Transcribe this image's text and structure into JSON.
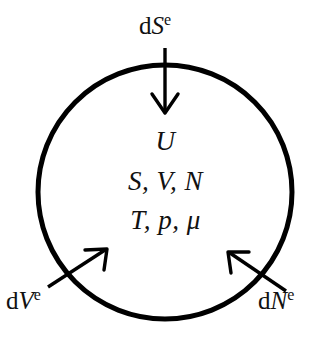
{
  "figure": {
    "background_color": "#ffffff",
    "stroke_color": "#000000",
    "width": 331,
    "height": 359
  },
  "system_boundary": {
    "shape": "circle",
    "center_x": 165,
    "center_y": 192,
    "radius": 127,
    "stroke_width": 5
  },
  "interior_variables": {
    "line_1": "U",
    "line_2": "S, V, N",
    "line_3": "T, p, μ"
  },
  "fluxes": [
    {
      "id": "entropy-flux",
      "prefix": "d",
      "symbol": "S",
      "superscript": "e",
      "label": "dSᵉ",
      "direction": "into-system-from-top",
      "arrow": {
        "x1": 165,
        "y1": 48,
        "x2": 165,
        "y2": 112
      }
    },
    {
      "id": "volume-flux",
      "prefix": "d",
      "symbol": "V",
      "superscript": "e",
      "label": "dVᵉ",
      "direction": "into-system-from-bottom-left",
      "arrow": {
        "x1": 48,
        "y1": 286,
        "x2": 107,
        "y2": 249
      }
    },
    {
      "id": "particle-flux",
      "prefix": "d",
      "symbol": "N",
      "superscript": "e",
      "label": "dNᵉ",
      "direction": "into-system-from-bottom-right",
      "arrow": {
        "x1": 286,
        "y1": 290,
        "x2": 227,
        "y2": 251
      }
    }
  ]
}
